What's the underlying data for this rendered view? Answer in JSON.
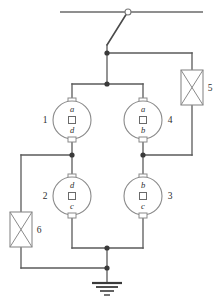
{
  "diagram": {
    "stroke_color": "#5a5a5a",
    "node_color": "#3a3a3a",
    "background": "#ffffff",
    "machines": [
      {
        "id": "machine-1",
        "number": "1",
        "number_side": "left",
        "top_terminal": "a",
        "bottom_terminal": "d",
        "center_symbol": "square",
        "cx": 72,
        "cy": 120,
        "r": 19
      },
      {
        "id": "machine-4",
        "number": "4",
        "number_side": "right",
        "top_terminal": "a",
        "bottom_terminal": "b",
        "center_symbol": "square",
        "cx": 143,
        "cy": 120,
        "r": 19
      },
      {
        "id": "machine-2",
        "number": "2",
        "number_side": "left",
        "top_terminal": "d",
        "bottom_terminal": "c",
        "center_symbol": "square",
        "cx": 72,
        "cy": 196,
        "r": 19
      },
      {
        "id": "machine-3",
        "number": "3",
        "number_side": "right",
        "top_terminal": "b",
        "bottom_terminal": "c",
        "center_symbol": "square",
        "cx": 143,
        "cy": 196,
        "r": 19
      }
    ],
    "reactors": [
      {
        "id": "reactor-5",
        "number": "5",
        "number_side": "right",
        "symbol": "crossed-box",
        "x": 181,
        "y": 70,
        "width": 22,
        "height": 35
      },
      {
        "id": "reactor-6",
        "number": "6",
        "number_side": "right",
        "symbol": "crossed-box",
        "x": 10,
        "y": 212,
        "width": 22,
        "height": 35
      }
    ],
    "switch": {
      "id": "disconnect-switch",
      "pivot_x": 128,
      "pivot_y": 12,
      "pivot_r": 3,
      "blade_end_x": 107,
      "blade_end_y": 45,
      "state": "open"
    },
    "busbar": {
      "x1": 60,
      "x2": 203,
      "y": 12
    },
    "ground": {
      "id": "earth-ground",
      "x": 107,
      "y": 283,
      "bars": 4
    },
    "junction_nodes": [
      {
        "x": 107,
        "y": 53
      },
      {
        "x": 107,
        "y": 84
      },
      {
        "x": 72,
        "y": 155
      },
      {
        "x": 143,
        "y": 155
      },
      {
        "x": 107,
        "y": 248
      },
      {
        "x": 107,
        "y": 268
      }
    ]
  }
}
